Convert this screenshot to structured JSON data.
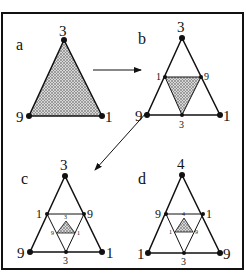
{
  "figure": {
    "border_color": "#111111",
    "fill_color": "#bdbdbd",
    "panels": [
      {
        "id": "a",
        "label": "a",
        "top": "3",
        "left": "9",
        "right": "1"
      },
      {
        "id": "b",
        "label": "b",
        "top": "3",
        "left": "9",
        "right": "1",
        "mid_left": "1",
        "mid_right": "9",
        "mid_bottom": "3"
      },
      {
        "id": "c",
        "label": "c",
        "top": "3",
        "left": "9",
        "right": "1",
        "mid_left": "1",
        "mid_right": "9",
        "mid_bottom": "3",
        "inner_top": "3",
        "inner_left": "9",
        "inner_right": "1"
      },
      {
        "id": "d",
        "label": "d",
        "top": "4",
        "left": "1",
        "right": "9",
        "mid_left": "9",
        "mid_right": "1",
        "mid_bottom": "3",
        "inner_top": "4",
        "inner_left": "1",
        "inner_right": "9"
      }
    ]
  }
}
